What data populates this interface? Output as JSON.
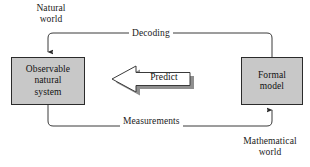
{
  "diagram": {
    "background_color": "#ffffff",
    "regions": [
      {
        "id": "natural",
        "label": "Natural\nworld"
      },
      {
        "id": "mathematical",
        "label": "Mathematical\nworld"
      }
    ],
    "nodes": [
      {
        "id": "observable-system",
        "label": "Observable\nnatural\nsystem",
        "fill_color": "#c8c8c8",
        "border_color": "#2b2b2b"
      },
      {
        "id": "formal-model",
        "label": "Formal\nmodel",
        "fill_color": "#c8c8c8",
        "border_color": "#2b2b2b"
      }
    ],
    "edges": [
      {
        "id": "decoding",
        "label": "Decoding",
        "from": "formal-model",
        "to": "observable-system",
        "position": "top",
        "line_color": "#3a3a3a"
      },
      {
        "id": "measurements",
        "label": "Measurements",
        "from": "observable-system",
        "to": "formal-model",
        "position": "bottom",
        "line_color": "#3a3a3a"
      },
      {
        "id": "predict",
        "label": "Predict",
        "from": "formal-model",
        "to": "observable-system",
        "position": "center",
        "style": "block-arrow",
        "fill_color": "#ffffff",
        "outline_color": "#3a3a3a",
        "shadow_color": "#8f8f8f"
      }
    ]
  }
}
